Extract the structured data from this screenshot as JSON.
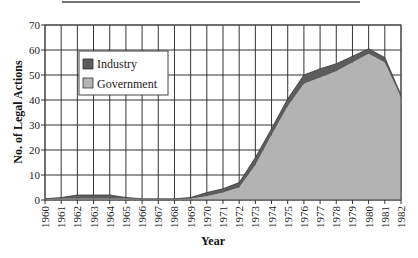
{
  "chart_data": {
    "type": "area",
    "stacked": true,
    "title": "",
    "xlabel": "Year",
    "ylabel": "No. of Legal Actions",
    "ylim": [
      0,
      70
    ],
    "yticks": [
      0,
      10,
      20,
      30,
      40,
      50,
      60,
      70
    ],
    "grid": true,
    "legend_position": "upper-left (inside)",
    "categories": [
      "1960",
      "1961",
      "1962",
      "1963",
      "1964",
      "1965",
      "1966",
      "1967",
      "1968",
      "1969",
      "1970",
      "1971",
      "1972",
      "1973",
      "1974",
      "1975",
      "1976",
      "1977",
      "1978",
      "1979",
      "1980",
      "1981",
      "1982"
    ],
    "series": [
      {
        "name": "Government",
        "color": "#b3b3b3",
        "values": [
          0.5,
          0.5,
          0.5,
          0.5,
          0.5,
          0.5,
          0.5,
          0.5,
          0.5,
          0.5,
          1.5,
          3,
          5,
          14,
          26,
          37.5,
          46.5,
          49,
          51.5,
          55,
          58.5,
          55,
          41
        ]
      },
      {
        "name": "Industry",
        "color": "#5c5c5c",
        "values": [
          0,
          0.5,
          1.5,
          1.5,
          1.5,
          0.5,
          0,
          0,
          0,
          0.5,
          1.5,
          1.5,
          2,
          3,
          2.5,
          3,
          3.5,
          3.5,
          3,
          2.5,
          2,
          2,
          1
        ]
      }
    ]
  },
  "legend": {
    "items": [
      {
        "label": "Industry",
        "color": "#5c5c5c"
      },
      {
        "label": "Government",
        "color": "#b3b3b3"
      }
    ]
  },
  "axes": {
    "x_title": "Year",
    "y_title": "No. of Legal Actions"
  },
  "colors": {
    "grid": "#333333",
    "frame": "#555555"
  }
}
